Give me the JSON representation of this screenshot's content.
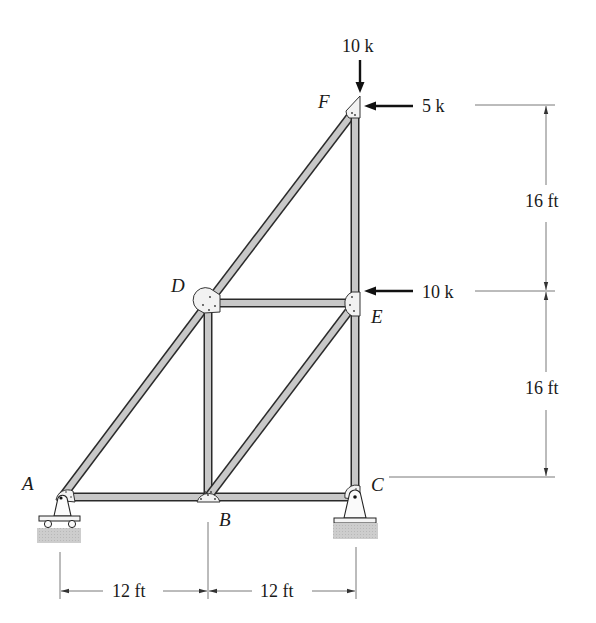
{
  "figure": {
    "type": "truss-diagram",
    "colors": {
      "member_fill": "#c8c8c8",
      "member_edge": "#2a2a2a",
      "gusset_fill": "#f2f2f2",
      "ground_fill": "#c4c4c4",
      "text": "#1a1a1a"
    }
  },
  "nodes": {
    "A": {
      "label": "A",
      "x": 62,
      "y": 497
    },
    "B": {
      "label": "B",
      "x": 208,
      "y": 497
    },
    "C": {
      "label": "C",
      "x": 355,
      "y": 497
    },
    "D": {
      "label": "D",
      "x": 208,
      "y": 303
    },
    "E": {
      "label": "E",
      "x": 355,
      "y": 303
    },
    "F": {
      "label": "F",
      "x": 355,
      "y": 110
    }
  },
  "members": [
    [
      "A",
      "B"
    ],
    [
      "B",
      "C"
    ],
    [
      "A",
      "D"
    ],
    [
      "D",
      "F"
    ],
    [
      "D",
      "E"
    ],
    [
      "D",
      "B"
    ],
    [
      "B",
      "E"
    ],
    [
      "C",
      "E"
    ],
    [
      "E",
      "F"
    ]
  ],
  "supports": {
    "A": "roller",
    "C": "pin"
  },
  "loads": [
    {
      "id": "load-F-vertical",
      "node": "F",
      "label": "10 k",
      "direction": "down"
    },
    {
      "id": "load-F-horizontal",
      "node": "F",
      "label": "5 k",
      "direction": "left"
    },
    {
      "id": "load-E-horizontal",
      "node": "E",
      "label": "10 k",
      "direction": "left"
    }
  ],
  "dimensions": {
    "horizontal": [
      {
        "label": "12 ft",
        "from": "A",
        "to": "B"
      },
      {
        "label": "12 ft",
        "from": "B",
        "to": "C"
      }
    ],
    "vertical": [
      {
        "label": "16 ft",
        "from": "F",
        "to": "E"
      },
      {
        "label": "16 ft",
        "from": "E",
        "to": "C"
      }
    ]
  }
}
